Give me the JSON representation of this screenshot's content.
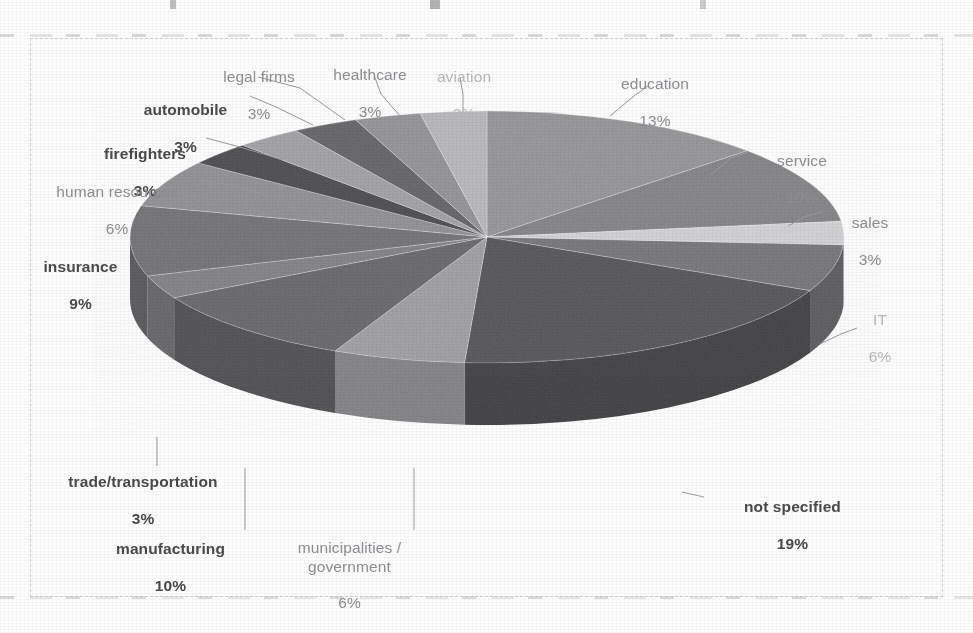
{
  "chart_data": {
    "type": "pie",
    "title": "",
    "subtitle": "",
    "xlabel": "",
    "ylabel": "",
    "legend_position": "none",
    "grid": false,
    "three_d": true,
    "units": "percent",
    "total_label": "100%",
    "categories": [
      "education",
      "service",
      "sales",
      "IT",
      "not specified",
      "municipalities / government",
      "manufacturing",
      "trade/transportation",
      "insurance",
      "human resources",
      "firefighters",
      "automobile",
      "legal firms",
      "healthcare",
      "aviation"
    ],
    "values": [
      13,
      10,
      3,
      6,
      19,
      6,
      10,
      3,
      9,
      6,
      3,
      3,
      3,
      3,
      3
    ],
    "slices": [
      {
        "id": "education",
        "label": "education",
        "percent_text": "13%",
        "value": 13,
        "style": "reg",
        "fill": "#8f8f92",
        "side": "#6f6f73",
        "start_deg": 0,
        "end_deg": 46.8
      },
      {
        "id": "service",
        "label": "service",
        "percent_text": "10%",
        "value": 10,
        "style": "reg",
        "fill": "#7c7c80",
        "side": "#5f5f63",
        "start_deg": 46.8,
        "end_deg": 82.8
      },
      {
        "id": "sales",
        "label": "sales",
        "percent_text": "3%",
        "value": 3,
        "style": "reg",
        "fill": "#d0d0d3",
        "side": "#a8a8ac",
        "start_deg": 82.8,
        "end_deg": 93.6
      },
      {
        "id": "it",
        "label": "IT",
        "percent_text": "6%",
        "value": 6,
        "style": "faint",
        "fill": "#6e6e72",
        "side": "#4f4f53",
        "start_deg": 93.6,
        "end_deg": 115.2
      },
      {
        "id": "not-specified",
        "label": "not specified",
        "percent_text": "19%",
        "value": 19,
        "style": "bold",
        "fill": "#4a4a4e",
        "side": "#2f2f33",
        "start_deg": 115.2,
        "end_deg": 183.6
      },
      {
        "id": "municipalities",
        "label": "municipalities /\ngovernment",
        "percent_text": "6%",
        "value": 6,
        "style": "reg",
        "fill": "#9a9a9e",
        "side": "#7a7a7e",
        "start_deg": 183.6,
        "end_deg": 205.2
      },
      {
        "id": "manufacturing",
        "label": "manufacturing",
        "percent_text": "10%",
        "value": 10,
        "style": "bold",
        "fill": "#5e5e62",
        "side": "#414145",
        "start_deg": 205.2,
        "end_deg": 241.2
      },
      {
        "id": "trade",
        "label": "trade/transportation",
        "percent_text": "3%",
        "value": 3,
        "style": "reg",
        "fill": "#7a7a7e",
        "side": "#5a5a5e",
        "start_deg": 241.2,
        "end_deg": 252.0
      },
      {
        "id": "insurance",
        "label": "insurance",
        "percent_text": "9%",
        "value": 9,
        "style": "bold",
        "fill": "#6a6a6e",
        "side": "#4b4b4f",
        "start_deg": 252.0,
        "end_deg": 284.4
      },
      {
        "id": "human-resources",
        "label": "human resources",
        "percent_text": "6%",
        "value": 6,
        "style": "reg",
        "fill": "#8a8a8e",
        "side": "#6a6a6e",
        "start_deg": 284.4,
        "end_deg": 306.0
      },
      {
        "id": "firefighters",
        "label": "firefighters",
        "percent_text": "3%",
        "value": 3,
        "style": "bold",
        "fill": "#3f3f43",
        "side": "#2a2a2e",
        "start_deg": 306.0,
        "end_deg": 316.8
      },
      {
        "id": "automobile",
        "label": "automobile",
        "percent_text": "3%",
        "value": 3,
        "style": "bold",
        "fill": "#9c9ca0",
        "side": "#7c7c80",
        "start_deg": 316.8,
        "end_deg": 327.6
      },
      {
        "id": "legal-firms",
        "label": "legal firms",
        "percent_text": "3%",
        "value": 3,
        "style": "reg",
        "fill": "#5a5a5e",
        "side": "#3e3e42",
        "start_deg": 327.6,
        "end_deg": 338.4
      },
      {
        "id": "healthcare",
        "label": "healthcare",
        "percent_text": "3%",
        "value": 3,
        "style": "reg",
        "fill": "#8d8d91",
        "side": "#6d6d71",
        "start_deg": 338.4,
        "end_deg": 349.2
      },
      {
        "id": "aviation",
        "label": "aviation",
        "percent_text": "3%",
        "value": 3,
        "style": "faint",
        "fill": "#b4b4b8",
        "side": "#909094",
        "start_deg": 349.2,
        "end_deg": 360.0
      }
    ]
  },
  "labels": {
    "education": {
      "name": "education",
      "pct": "13%"
    },
    "service": {
      "name": "service",
      "pct": "10%"
    },
    "sales": {
      "name": "sales",
      "pct": "3%"
    },
    "it": {
      "name": "IT",
      "pct": "6%"
    },
    "not_specified": {
      "name": "not specified",
      "pct": "19%"
    },
    "municipalities": {
      "name": "municipalities /\ngovernment",
      "pct": "6%"
    },
    "manufacturing": {
      "name": "manufacturing",
      "pct": "10%"
    },
    "trade": {
      "name": "trade/transportation",
      "pct": "3%"
    },
    "insurance": {
      "name": "insurance",
      "pct": "9%"
    },
    "human_resources": {
      "name": "human resources",
      "pct": "6%"
    },
    "firefighters": {
      "name": "firefighters",
      "pct": "3%"
    },
    "automobile": {
      "name": "automobile",
      "pct": "3%"
    },
    "legal_firms": {
      "name": "legal firms",
      "pct": "3%"
    },
    "healthcare": {
      "name": "healthcare",
      "pct": "3%"
    },
    "aviation": {
      "name": "aviation",
      "pct": "3%"
    }
  },
  "colors": {
    "label_bold": "#4a4a4d",
    "label_regular": "#8e8e93",
    "label_faint": "#b9b9bd",
    "leader_line": "#9a9a9e",
    "background": "#ffffff",
    "plot_background": "#fcfcfc",
    "frame": "#b2b2b6"
  }
}
